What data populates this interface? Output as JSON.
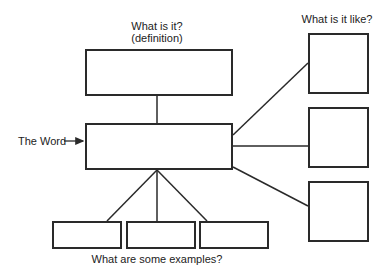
{
  "diagram": {
    "type": "frayer-style vocabulary map",
    "center_label": "The Word",
    "definition_prompt_line1": "What is it?",
    "definition_prompt_line2": "(definition)",
    "properties_prompt": "What is it like?",
    "examples_prompt": "What are some examples?",
    "boxes": {
      "definition": {
        "x": 85,
        "y": 49,
        "w": 148,
        "h": 47
      },
      "word": {
        "x": 85,
        "y": 123,
        "w": 148,
        "h": 47
      },
      "properties": [
        {
          "x": 308,
          "y": 33,
          "w": 61,
          "h": 61
        },
        {
          "x": 308,
          "y": 107,
          "w": 61,
          "h": 61
        },
        {
          "x": 308,
          "y": 181,
          "w": 61,
          "h": 61
        }
      ],
      "examples": [
        {
          "x": 52,
          "y": 221,
          "w": 70,
          "h": 28
        },
        {
          "x": 126,
          "y": 221,
          "w": 70,
          "h": 28
        },
        {
          "x": 199,
          "y": 221,
          "w": 70,
          "h": 28
        }
      ]
    },
    "line_color": "#2a2a2a"
  }
}
